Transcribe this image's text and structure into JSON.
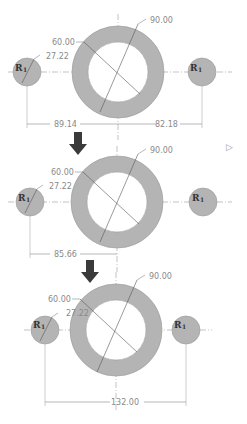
{
  "colors": {
    "fill": "#b4b4b4",
    "stroke": "#8c8c8c",
    "centerline": "#9a9a9a",
    "arrow": "#3a3a3a",
    "text": "#8a8a8a",
    "background": "#ffffff"
  },
  "panels": [
    {
      "outer_diameter": "90.00",
      "inner_diameter": "60.00",
      "small_diameter": "27.22",
      "left_label": "R",
      "left_sub": "1",
      "right_label": "R",
      "right_sub": "1",
      "dim_left": "89.14",
      "dim_right": "82.18"
    },
    {
      "outer_diameter": "90.00",
      "inner_diameter": "60.00",
      "small_diameter": "27.22",
      "left_label": "R",
      "left_sub": "1",
      "right_label": "R",
      "right_sub": "1",
      "dim_left": "85.66"
    },
    {
      "outer_diameter": "90.00",
      "inner_diameter": "60.00",
      "small_diameter": "27.22",
      "left_label": "R",
      "left_sub": "1",
      "right_label": "R",
      "right_sub": "1",
      "dim_total": "132.00"
    }
  ],
  "arrows": [
    "down-arrow-1",
    "down-arrow-2"
  ]
}
